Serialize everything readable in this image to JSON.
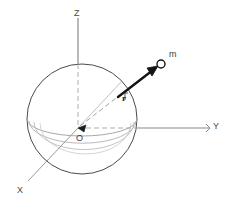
{
  "figure": {
    "type": "spherical-coordinate-diagram",
    "background_color": "#ffffff",
    "labels": {
      "z_axis": "Z",
      "y_axis": "Y",
      "x_axis": "X",
      "origin": "O",
      "radius_vector": "r",
      "mass_point": "m"
    },
    "colors": {
      "sphere_outline": "#4b4b4b",
      "equator_arc": "#8c8c8c",
      "axis_line": "#8a8a8a",
      "dashed_line": "#9a9a9a",
      "vector": "#1a1a1a",
      "label_text": "#4a4a4a"
    },
    "geometry": {
      "origin_px": [
        78,
        128
      ],
      "sphere_center_px": [
        82,
        119
      ],
      "sphere_radius_px": 55,
      "z_axis_top_px": [
        78,
        18
      ],
      "y_axis_end_px": [
        210,
        128
      ],
      "x_axis_end_px": [
        28,
        181
      ],
      "mass_point_px": [
        160,
        65
      ],
      "vector_tail_px": [
        118,
        96
      ]
    }
  }
}
